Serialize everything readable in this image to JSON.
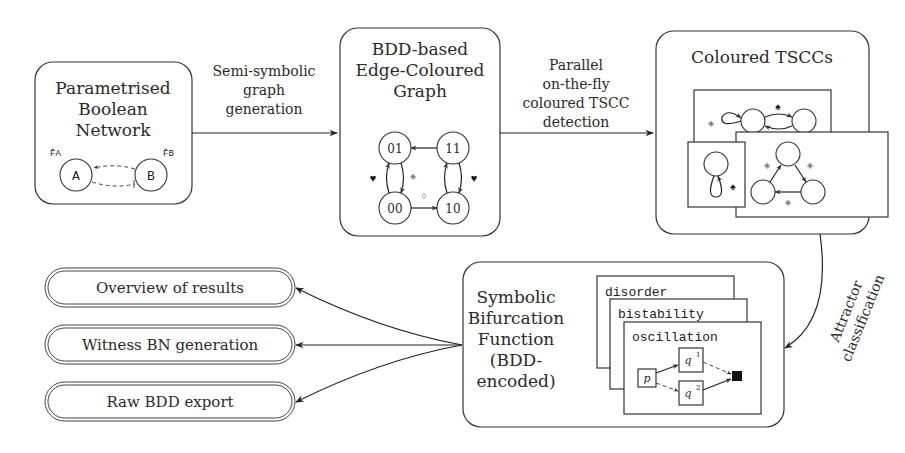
{
  "stages": {
    "pbn": {
      "title_lines": [
        "Parametrised",
        "Boolean",
        "Network"
      ],
      "nodes": [
        "A",
        "B"
      ],
      "labels": [
        "F̂A",
        "F̂B"
      ]
    },
    "graph": {
      "title_lines": [
        "BDD-based",
        "Edge-Coloured",
        "Graph"
      ],
      "nodes": [
        "01",
        "11",
        "00",
        "10"
      ]
    },
    "tscc": {
      "title_lines": [
        "Coloured TSCCs"
      ]
    },
    "sbf": {
      "title_lines": [
        "Symbolic",
        "Bifurcation",
        "Function",
        "(BDD-",
        "encoded)"
      ],
      "cards": [
        "disorder",
        "bistability",
        "oscillation"
      ],
      "bdd_nodes": [
        "p",
        "q",
        "q"
      ],
      "bdd_sups": [
        "1",
        "2"
      ]
    }
  },
  "edges": {
    "e1": [
      "Semi-symbolic",
      "graph",
      "generation"
    ],
    "e2": [
      "Parallel",
      "on-the-fly",
      "coloured TSCC",
      "detection"
    ],
    "e3": [
      "Attractor",
      "classification"
    ]
  },
  "outputs": [
    "Overview of results",
    "Witness BN generation",
    "Raw BDD export"
  ]
}
